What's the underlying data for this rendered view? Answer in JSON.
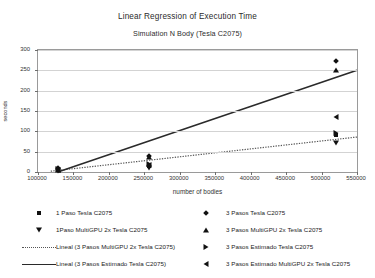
{
  "chart_data": {
    "type": "scatter",
    "title": "Linear Regression of Execution Time",
    "subtitle": "Simulation N Body (Tesla C2075)",
    "xlabel": "number of bodies",
    "ylabel": "seconds",
    "xlim": [
      100000,
      550000
    ],
    "ylim": [
      0,
      300
    ],
    "xticks": [
      100000,
      150000,
      200000,
      250000,
      300000,
      350000,
      400000,
      450000,
      500000,
      550000
    ],
    "xtick_labels": [
      "100000",
      "150000",
      "200000",
      "250000",
      "300000",
      "350000",
      "400000",
      "450000",
      "500000",
      "550000"
    ],
    "yticks": [
      0,
      50,
      100,
      150,
      200,
      250,
      300
    ],
    "ytick_labels": [
      "0",
      "50",
      "100",
      "150",
      "200",
      "250",
      "300"
    ],
    "grid": "horizontal",
    "legend_position": "bottom",
    "series": [
      {
        "name": "1 Paso Tesla C2075",
        "marker": "square",
        "points": [
          [
            128000,
            4
          ],
          [
            256000,
            14
          ],
          [
            520000,
            92
          ]
        ]
      },
      {
        "name": "1Paso MultiGPU 2x Tesla C2075",
        "marker": "triangle-down",
        "points": [
          [
            128000,
            2
          ],
          [
            256000,
            10
          ],
          [
            520000,
            72
          ]
        ]
      },
      {
        "name": "3 Pasos Tesla C2075",
        "marker": "diamond",
        "points": [
          [
            128000,
            9
          ],
          [
            256000,
            40
          ],
          [
            520000,
            272
          ]
        ]
      },
      {
        "name": "3 Pasos MultiGPU 2x Tesla C2075",
        "marker": "triangle-up",
        "points": [
          [
            128000,
            6
          ],
          [
            256000,
            36
          ],
          [
            520000,
            252
          ]
        ]
      },
      {
        "name": "3 Pasos Estimado Tesla C2075",
        "marker": "triangle-right",
        "points": [
          [
            128000,
            8
          ],
          [
            256000,
            20
          ],
          [
            520000,
            95
          ]
        ]
      },
      {
        "name": "3 Pasos Estimado MultiGPU 2x Tesla C2075",
        "marker": "triangle-left",
        "points": [
          [
            128000,
            5
          ],
          [
            256000,
            18
          ],
          [
            520000,
            135
          ]
        ]
      }
    ],
    "trendlines": [
      {
        "name": "Lineal (3 Pasos MultiGPU 2x Tesla C2075)",
        "style": "dotted",
        "from": [
          118000,
          2
        ],
        "to": [
          550000,
          86
        ]
      },
      {
        "name": "Lineal (3 Pasos Estimado Tesla C2075)",
        "style": "solid",
        "from": [
          128000,
          0
        ],
        "to": [
          550000,
          250
        ]
      }
    ]
  },
  "legend": {
    "left": [
      {
        "label": "1 Paso Tesla C2075",
        "key": "square"
      },
      {
        "label": "1Paso MultiGPU 2x Tesla C2075",
        "key": "triangle-down"
      },
      {
        "label": "Lineal (3 Pasos MultiGPU 2x Tesla C2075)",
        "key": "dotted-line"
      },
      {
        "label": "Lineal (3 Pasos Estimado Tesla C2075)",
        "key": "solid-line"
      }
    ],
    "right": [
      {
        "label": "3 Pasos Tesla C2075",
        "key": "diamond"
      },
      {
        "label": "3 Pasos MultiGPU 2x Tesla C2075",
        "key": "triangle-up"
      },
      {
        "label": "3 Pasos Estimado Tesla C2075",
        "key": "triangle-right"
      },
      {
        "label": "3 Pasos Estimado MultiGPU 2x Tesla C2075",
        "key": "triangle-left"
      }
    ]
  }
}
